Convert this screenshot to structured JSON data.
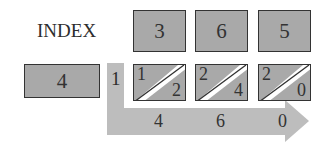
{
  "title": "INDEX",
  "multiplicand_digits": [
    "3",
    "6",
    "5"
  ],
  "multiplier": "4",
  "carry_in": "1",
  "lattice_cells": [
    {
      "tens": "1",
      "ones": "2"
    },
    {
      "tens": "2",
      "ones": "4"
    },
    {
      "tens": "2",
      "ones": "0"
    }
  ],
  "result_digits": [
    "4",
    "6",
    "0"
  ],
  "colors": {
    "box_fill": "#a9a9a9",
    "border": "#333333",
    "arrow_fill": "#bdbdbd",
    "diagonal_stripe": "#ffffff"
  }
}
